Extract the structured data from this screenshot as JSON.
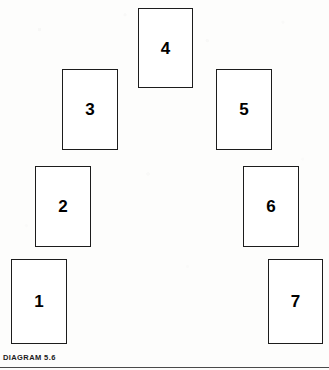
{
  "figure": {
    "caption": "DIAGRAM 5.6",
    "background_color": "#fdfdfc",
    "stroke_color": "#1c1c1c",
    "label_color": "#000000",
    "rule_color": "#4a4a4a"
  },
  "diagram_data": {
    "type": "diagram",
    "description": "Seven numbered rectangular cards arranged in a symmetric arch",
    "shape": "rectangle",
    "count": 7,
    "cards": [
      {
        "label": "1",
        "x": 11,
        "y": 259,
        "width": 56,
        "height": 85
      },
      {
        "label": "2",
        "x": 35,
        "y": 166,
        "width": 56,
        "height": 81
      },
      {
        "label": "3",
        "x": 62,
        "y": 69,
        "width": 56,
        "height": 81
      },
      {
        "label": "4",
        "x": 138,
        "y": 8,
        "width": 55,
        "height": 80
      },
      {
        "label": "5",
        "x": 216,
        "y": 69,
        "width": 56,
        "height": 81
      },
      {
        "label": "6",
        "x": 243,
        "y": 166,
        "width": 56,
        "height": 81
      },
      {
        "label": "7",
        "x": 268,
        "y": 259,
        "width": 55,
        "height": 85
      }
    ]
  }
}
